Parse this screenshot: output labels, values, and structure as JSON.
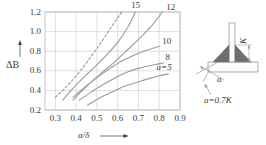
{
  "chart_data": {
    "type": "line",
    "title": "",
    "xlabel": "a/δ",
    "ylabel": "ΔB",
    "xlim": [
      0.25,
      0.9
    ],
    "ylim": [
      0.2,
      1.2
    ],
    "grid": true,
    "legend": "inline-curve-labels",
    "xticks": [
      "0.3",
      "0.4",
      "0.5",
      "0.6",
      "0.7",
      "0.8",
      "0.9"
    ],
    "xtick_values": [
      0.3,
      0.4,
      0.5,
      0.6,
      0.7,
      0.8,
      0.9
    ],
    "yticks": [
      "0.2",
      "0.4",
      "0.6",
      "0.8",
      "1.0",
      "1.2"
    ],
    "ytick_values": [
      0.2,
      0.4,
      0.6,
      0.8,
      1.0,
      1.2
    ],
    "series": [
      {
        "name": "dashed-reference",
        "label": "",
        "style": "dashed",
        "x": [
          0.3,
          0.34,
          0.38,
          0.42,
          0.46,
          0.5,
          0.54,
          0.58,
          0.62
        ],
        "values": [
          0.33,
          0.41,
          0.5,
          0.6,
          0.71,
          0.83,
          0.95,
          1.08,
          1.2
        ]
      },
      {
        "name": "a-15",
        "label": "15",
        "style": "solid",
        "x": [
          0.335,
          0.38,
          0.42,
          0.46,
          0.5,
          0.55,
          0.6,
          0.65,
          0.685
        ],
        "values": [
          0.3,
          0.41,
          0.5,
          0.58,
          0.66,
          0.77,
          0.89,
          1.05,
          1.2
        ]
      },
      {
        "name": "a-12",
        "label": "12",
        "style": "solid",
        "x": [
          0.385,
          0.43,
          0.48,
          0.53,
          0.58,
          0.64,
          0.7,
          0.76,
          0.815
        ],
        "values": [
          0.3,
          0.4,
          0.5,
          0.59,
          0.68,
          0.8,
          0.92,
          1.05,
          1.2
        ]
      },
      {
        "name": "a-10",
        "label": "10",
        "style": "solid",
        "x": [
          0.385,
          0.44,
          0.5,
          0.56,
          0.62,
          0.68,
          0.74,
          0.8
        ],
        "values": [
          0.33,
          0.43,
          0.53,
          0.62,
          0.7,
          0.76,
          0.81,
          0.85
        ]
      },
      {
        "name": "a-8",
        "label": "8",
        "style": "solid",
        "x": [
          0.415,
          0.47,
          0.53,
          0.59,
          0.65,
          0.71,
          0.77,
          0.82
        ],
        "values": [
          0.3,
          0.38,
          0.46,
          0.53,
          0.59,
          0.63,
          0.66,
          0.68
        ]
      },
      {
        "name": "a-5",
        "label": "a=5",
        "style": "solid",
        "x": [
          0.455,
          0.51,
          0.57,
          0.63,
          0.69,
          0.75,
          0.8,
          0.845
        ],
        "values": [
          0.25,
          0.32,
          0.38,
          0.44,
          0.48,
          0.52,
          0.55,
          0.57
        ]
      }
    ]
  },
  "axes": {
    "y_label": "ΔB",
    "x_label": "a/δ"
  },
  "curve_labels": [
    {
      "text": "15"
    },
    {
      "text": "12"
    },
    {
      "text": "10"
    },
    {
      "text": "8"
    },
    {
      "text": "a=5"
    }
  ],
  "diagram": {
    "name": "fillet-weld-t-joint",
    "k_label": "K",
    "a_label": "a",
    "relation_label": "a=0.7K"
  },
  "colors": {
    "curve": "#9a9a9a",
    "grid": "#c9c9c9",
    "frame": "#b5b5b5",
    "text": "#3b3b3b",
    "weld_fill": "#6e6e6e",
    "part_fill": "#fbfbfb",
    "part_stroke": "#9a9a9a"
  }
}
